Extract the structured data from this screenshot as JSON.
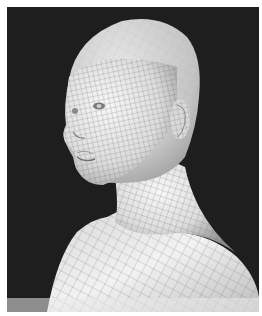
{
  "image": {
    "subject": "3D wireframe topology mesh of a female head and bust",
    "background_color": "#1e1e1e",
    "border_color": "#ffffff",
    "mesh_surface_color": "#e8e8e8",
    "mesh_line_color": "#6f6f6f",
    "view": "three-quarter left profile"
  }
}
